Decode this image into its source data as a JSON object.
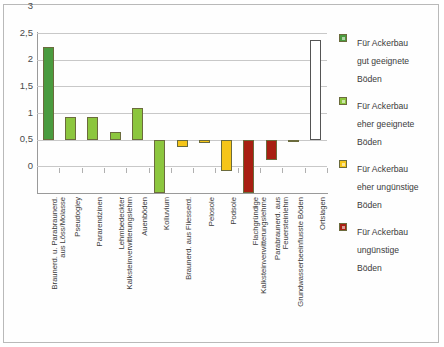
{
  "chart_data": {
    "type": "bar",
    "title": "",
    "xlabel": "",
    "ylabel": "",
    "ylim": [
      0,
      3
    ],
    "ytick_labels": [
      "0",
      "0,5",
      "1",
      "1,5",
      "2",
      "2,5",
      "3"
    ],
    "ytick_values": [
      0,
      0.5,
      1,
      1.5,
      2,
      2.5,
      3
    ],
    "baseline": 1,
    "grid": true,
    "legend_position": "right",
    "categories": [
      "Braunerd. u. Parabraunerd. aus Löss/Molasse",
      "Pseudogley",
      "Pararendzinen",
      "Lehmbedeckter Kalksteinverwitterungslehm",
      "Auenböden",
      "Kolluvium",
      "Braunerd. aus Fliesserd.",
      "Pelosole",
      "Podsole",
      "Flachgründige Kalksteinverwitterungslehme",
      "Parabraunerd. aus Feuersteinlehm",
      "Grundwasserbeeinflusste Böden",
      "Ortslagen"
    ],
    "categories_wrapped": [
      [
        "Braunerd. u. Parabraunerd.",
        "aus Löss/Molasse"
      ],
      [
        "Pseudogley",
        ""
      ],
      [
        "Pararendzinen",
        ""
      ],
      [
        "Lehmbedeckter",
        "Kalksteinverwitterungslehm"
      ],
      [
        "Auenböden",
        ""
      ],
      [
        "Kolluvium",
        ""
      ],
      [
        "Braunerd. aus Fliesserd.",
        ""
      ],
      [
        "Pelosole",
        ""
      ],
      [
        "Podsole",
        ""
      ],
      [
        "Flachgründige",
        "Kalksteinverwitterungslehme"
      ],
      [
        "Parabraunerd. aus",
        "Feuersteinlehm"
      ],
      [
        "Grundwasserbeeinflusste Böden",
        ""
      ],
      [
        "Ortslagen",
        ""
      ]
    ],
    "values": [
      2.73,
      1.42,
      1.42,
      1.14,
      1.6,
      0.0,
      0.87,
      0.93,
      0.41,
      0.0,
      0.62,
      0.95,
      2.87
    ],
    "series_class": [
      "gut-geeignet",
      "eher-geeignet",
      "eher-geeignet",
      "eher-geeignet",
      "eher-geeignet",
      "eher-geeignet",
      "eher-unguenstig",
      "eher-unguenstig",
      "eher-unguenstig",
      "unguenstig",
      "unguenstig",
      "unguenstig",
      "sonstige"
    ]
  },
  "legend": {
    "items": [
      {
        "label_lines": [
          "Für Ackerbau",
          "gut geeignete",
          "Böden"
        ],
        "color": "#4a9b3f",
        "key": "gut-geeignet"
      },
      {
        "label_lines": [
          "Für Ackerbau",
          "eher geeignete",
          "Böden"
        ],
        "color": "#8cc63e",
        "key": "eher-geeignet"
      },
      {
        "label_lines": [
          "Für Ackerbau",
          "eher ungünstige",
          "Böden"
        ],
        "color": "#f5c518",
        "key": "eher-unguenstig"
      },
      {
        "label_lines": [
          "Für Ackerbau",
          "ungünstige",
          "Böden"
        ],
        "color": "#a81f12",
        "key": "unguenstig"
      }
    ]
  },
  "colors": {
    "gut-geeignet": "#4a9b3f",
    "eher-geeignet": "#8cc63e",
    "eher-unguenstig": "#f5c518",
    "unguenstig": "#a81f12",
    "sonstige": "#ffffff",
    "grid": "#c8c8c8",
    "axis": "#9a9a9a",
    "text": "#3b3b3b",
    "frame": "#b9b9b9"
  }
}
